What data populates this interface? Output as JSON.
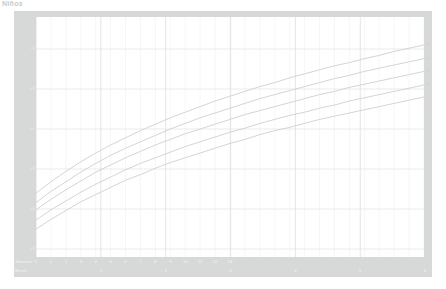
{
  "page": {
    "title": "Niños"
  },
  "axes": {
    "y_title": "Longitud (cm)",
    "x_title": "Edad (en semanas o meses cumplidos)",
    "weeks_row_label": "Semanas",
    "months_row_label": "Meses"
  },
  "chart_data": {
    "type": "line",
    "title": "Niños",
    "xlabel": "Edad (en semanas o meses cumplidos)",
    "ylabel": "Longitud (cm)",
    "xlim": [
      0,
      26
    ],
    "ylim": [
      44,
      74
    ],
    "grid": true,
    "legend_position": "right-inline",
    "x_unit": "weeks",
    "y_ticks": [
      45,
      50,
      55,
      60,
      65,
      70
    ],
    "y_tick_labels": [
      "45",
      "50",
      "55",
      "60",
      "65",
      "70"
    ],
    "week_ticks": [
      0,
      1,
      2,
      3,
      4,
      5,
      6,
      7,
      8,
      9,
      10,
      11,
      12,
      13
    ],
    "week_tick_labels": [
      "0",
      "1",
      "2",
      "3",
      "4",
      "5",
      "6",
      "7",
      "8",
      "9",
      "10",
      "11",
      "12",
      "13"
    ],
    "month_ticks": [
      4.345,
      8.69,
      13.04,
      17.38,
      21.73,
      26.07
    ],
    "month_tick_labels": [
      "1",
      "2",
      "3",
      "4",
      "5",
      "6"
    ],
    "x": [
      0,
      1,
      2,
      3,
      4,
      5,
      6,
      7,
      8,
      9,
      10,
      11,
      12,
      13,
      14,
      15,
      16,
      17,
      18,
      19,
      20,
      21,
      22,
      23,
      24,
      25,
      26
    ],
    "series": [
      {
        "name": "97",
        "label": "97",
        "color": "#cfcfcf",
        "values": [
          52.0,
          53.4,
          54.7,
          55.9,
          57.0,
          58.0,
          58.9,
          59.8,
          60.6,
          61.4,
          62.1,
          62.8,
          63.5,
          64.1,
          64.7,
          65.3,
          65.8,
          66.4,
          66.9,
          67.4,
          67.9,
          68.3,
          68.8,
          69.2,
          69.7,
          70.1,
          70.5
        ]
      },
      {
        "name": "85",
        "label": "85",
        "color": "#cfcfcf",
        "values": [
          50.8,
          52.2,
          53.4,
          54.6,
          55.7,
          56.7,
          57.6,
          58.4,
          59.2,
          60.0,
          60.7,
          61.4,
          62.0,
          62.6,
          63.2,
          63.8,
          64.3,
          64.8,
          65.3,
          65.8,
          66.3,
          66.7,
          67.2,
          67.6,
          68.0,
          68.4,
          68.8
        ]
      },
      {
        "name": "50",
        "label": "50",
        "color": "#cfcfcf",
        "values": [
          49.9,
          51.2,
          52.4,
          53.5,
          54.6,
          55.5,
          56.4,
          57.2,
          58.0,
          58.7,
          59.4,
          60.0,
          60.6,
          61.2,
          61.8,
          62.3,
          62.8,
          63.3,
          63.8,
          64.3,
          64.7,
          65.2,
          65.6,
          66.0,
          66.4,
          66.8,
          67.2
        ]
      },
      {
        "name": "15",
        "label": "15",
        "color": "#cfcfcf",
        "values": [
          48.6,
          49.9,
          51.0,
          52.1,
          53.1,
          54.0,
          54.9,
          55.7,
          56.4,
          57.1,
          57.8,
          58.4,
          59.0,
          59.6,
          60.1,
          60.7,
          61.2,
          61.7,
          62.1,
          62.6,
          63.0,
          63.5,
          63.9,
          64.3,
          64.7,
          65.1,
          65.5
        ]
      },
      {
        "name": "3",
        "label": "3",
        "color": "#cfcfcf",
        "values": [
          47.5,
          48.7,
          49.8,
          50.9,
          51.8,
          52.7,
          53.6,
          54.3,
          55.1,
          55.8,
          56.4,
          57.0,
          57.6,
          58.2,
          58.7,
          59.3,
          59.8,
          60.2,
          60.7,
          61.2,
          61.6,
          62.0,
          62.4,
          62.8,
          63.2,
          63.6,
          64.0
        ]
      }
    ]
  },
  "colors": {
    "frame": "#d7d9d9",
    "plot_background": "#ffffff",
    "grid_minor": "#eef0ef",
    "grid_major": "#dfe2e1",
    "curve": "#cfcfcf",
    "axis_text": "#f2f2f2"
  }
}
